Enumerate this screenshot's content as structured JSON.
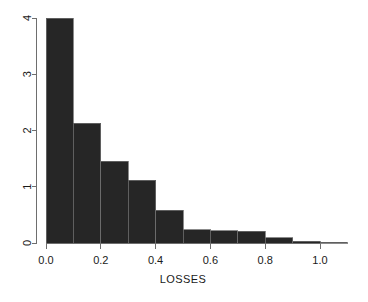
{
  "chart_data": {
    "type": "bar",
    "subtype": "histogram",
    "title": "",
    "subtitle": "",
    "xlabel": "LOSSES",
    "ylabel": "",
    "bin_width": 0.1,
    "bin_edges": [
      0.0,
      0.1,
      0.2,
      0.3,
      0.4,
      0.5,
      0.6,
      0.7,
      0.8,
      0.9,
      1.0,
      1.1
    ],
    "categories": [
      "0.0-0.1",
      "0.1-0.2",
      "0.2-0.3",
      "0.3-0.4",
      "0.4-0.5",
      "0.5-0.6",
      "0.6-0.7",
      "0.7-0.8",
      "0.8-0.9",
      "0.9-1.0",
      "1.0-1.1"
    ],
    "values": [
      4.0,
      2.13,
      1.45,
      1.12,
      0.58,
      0.24,
      0.22,
      0.21,
      0.09,
      0.03,
      0.01
    ],
    "xlim": [
      0.0,
      1.1
    ],
    "ylim": [
      0,
      4
    ],
    "xticks": [
      0.0,
      0.2,
      0.4,
      0.6,
      0.8,
      1.0
    ],
    "xtick_labels": [
      "0.0",
      "0.2",
      "0.4",
      "0.6",
      "0.8",
      "1.0"
    ],
    "yticks": [
      0,
      1,
      2,
      3,
      4
    ],
    "ytick_labels": [
      "0",
      "1",
      "2",
      "3",
      "4"
    ],
    "grid": false,
    "legend": false,
    "legend_position": "none",
    "bar_fill_color": "#262626",
    "bar_border_color": "#6e6e6e",
    "axis_color": "#6e6e6e",
    "background_color": "#ffffff",
    "ytick_label_rotation": -90
  },
  "axes": {
    "x_axis_label": "LOSSES",
    "y_axis_label": ""
  }
}
